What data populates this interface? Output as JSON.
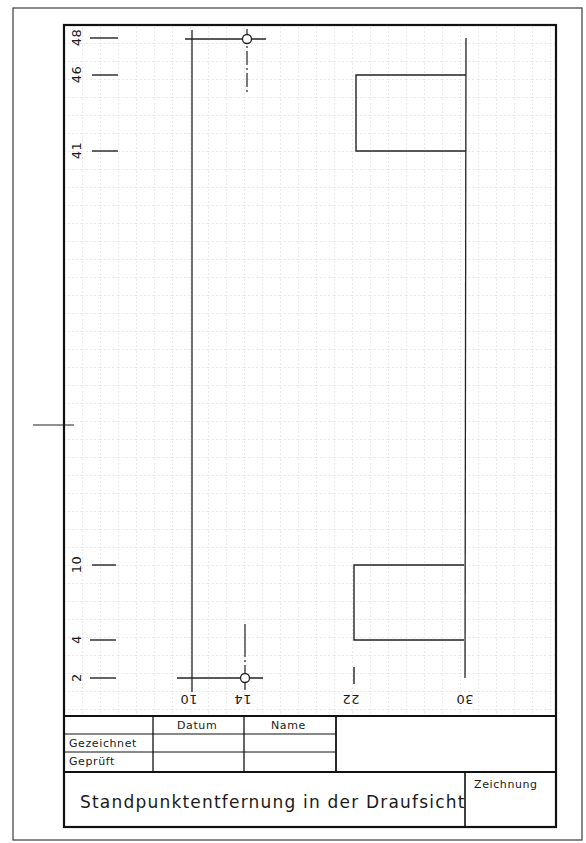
{
  "drawing": {
    "title": "Standpunktentfernung in der Draufsicht",
    "grid": {
      "spacing_px": 18,
      "color": "#c8c8c8",
      "style": "dashed"
    },
    "y_axis_labels": [
      {
        "value": "48",
        "y": 38
      },
      {
        "value": "46",
        "y": 75
      },
      {
        "value": "41",
        "y": 151
      },
      {
        "value": "10",
        "y": 565
      },
      {
        "value": "4",
        "y": 640
      },
      {
        "value": "2",
        "y": 678
      }
    ],
    "x_axis_labels": [
      {
        "value": "10",
        "x": 192
      },
      {
        "value": "14",
        "x": 245
      },
      {
        "value": "22",
        "x": 354
      },
      {
        "value": "30",
        "x": 466
      }
    ],
    "shapes": {
      "upper_rect": {
        "x_from": 22,
        "x_to": 30,
        "y_from": 41,
        "y_to": 46
      },
      "lower_rect": {
        "x_from": 22,
        "x_to": 30,
        "y_from": 4,
        "y_to": 10
      },
      "standpoint_top": {
        "x": 14,
        "y": 48
      },
      "standpoint_bottom": {
        "x": 14,
        "y": 2
      }
    }
  },
  "title_block": {
    "header_datum": "Datum",
    "header_name": "Name",
    "row_gezeichnet": "Gezeichnet",
    "row_geprueft": "Geprüft",
    "title": "Standpunktentfernung in der Draufsicht",
    "zeichnung_label": "Zeichnung"
  }
}
